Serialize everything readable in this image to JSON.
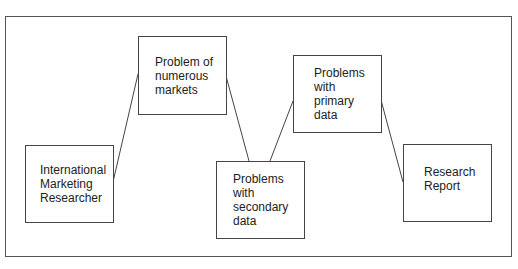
{
  "diagram": {
    "type": "flow",
    "nodes": [
      {
        "id": "researcher",
        "label": "International\nMarketing\nResearcher"
      },
      {
        "id": "numerous_markets",
        "label": "Problem of\nnumerous\nmarkets"
      },
      {
        "id": "secondary_data",
        "label": "Problems\nwith\nsecondary\ndata"
      },
      {
        "id": "primary_data",
        "label": "Problems\nwith\nprimary\ndata"
      },
      {
        "id": "report",
        "label": "Research\nReport"
      }
    ],
    "edges": [
      {
        "from": "researcher",
        "to": "numerous_markets"
      },
      {
        "from": "numerous_markets",
        "to": "secondary_data"
      },
      {
        "from": "secondary_data",
        "to": "primary_data"
      },
      {
        "from": "primary_data",
        "to": "report"
      }
    ],
    "colors": {
      "line": "#444444",
      "text": "#222222",
      "background": "#ffffff"
    }
  }
}
